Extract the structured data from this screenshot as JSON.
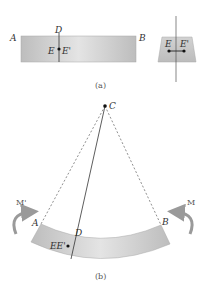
{
  "figure": {
    "part_a": {
      "caption": "(a)",
      "labels": {
        "A": "A",
        "B": "B",
        "D": "D",
        "E": "E",
        "E_prime": "E'"
      },
      "cross_section": {
        "E": "E",
        "E_prime": "E'"
      }
    },
    "part_b": {
      "caption": "(b)",
      "labels": {
        "A": "A",
        "B": "B",
        "C": "C",
        "D": "D",
        "EE_prime": "EE'"
      },
      "moments": {
        "left": "M'",
        "right": "M"
      }
    },
    "colors": {
      "beam_fill": "#c8c8c8",
      "beam_highlight": "#e6e6e6",
      "arrow": "#9a9a9a",
      "line": "#333333"
    }
  }
}
